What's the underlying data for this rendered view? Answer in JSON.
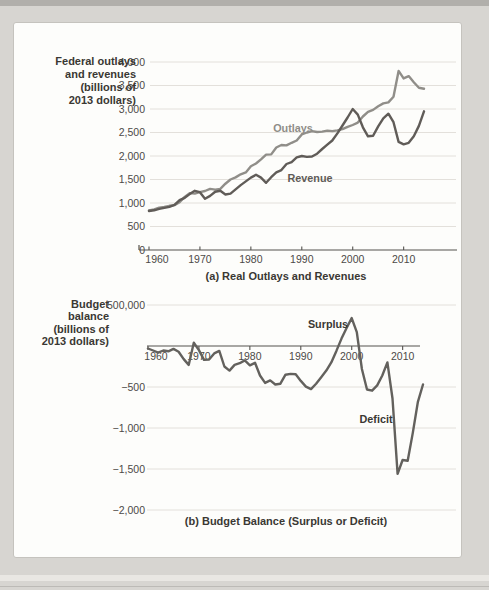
{
  "colors": {
    "outlays_line": "#908e89",
    "revenue_line": "#605c58",
    "balance_line": "#63615d",
    "gridline": "#e3e0db",
    "axis": "#55534f",
    "tick_text": "#4c4a47",
    "label_text": "#3a3833"
  },
  "chart_data": [
    {
      "panel": "a",
      "type": "line",
      "caption": "(a) Real Outlays and Revenues",
      "y_axis_title_lines": [
        "Federal outlays",
        "and revenues",
        "(billions of",
        "2013 dollars)"
      ],
      "y_tick_labels": [
        "4,000",
        "3,500",
        "3,000",
        "2,500",
        "2,000",
        "1,500",
        "1,000",
        "500",
        "0"
      ],
      "y_tick_values": [
        4000,
        3500,
        3000,
        2500,
        2000,
        1500,
        1000,
        500,
        0
      ],
      "x_tick_labels": [
        "1960",
        "1970",
        "1980",
        "1990",
        "2000",
        "2010"
      ],
      "x_tick_years": [
        1960,
        1970,
        1980,
        1990,
        2000,
        2010
      ],
      "xlim": [
        1960,
        2014
      ],
      "ylim": [
        0,
        4000
      ],
      "grid": true,
      "series": [
        {
          "name": "Outlays",
          "color": "#908e89",
          "year_start": 1960,
          "year_end": 2014,
          "values": [
            840,
            865,
            900,
            915,
            940,
            955,
            1020,
            1130,
            1210,
            1200,
            1230,
            1255,
            1300,
            1285,
            1300,
            1410,
            1500,
            1545,
            1610,
            1650,
            1780,
            1840,
            1930,
            2030,
            2035,
            2180,
            2235,
            2225,
            2280,
            2330,
            2460,
            2500,
            2530,
            2510,
            2520,
            2540,
            2530,
            2545,
            2570,
            2620,
            2660,
            2710,
            2840,
            2940,
            2980,
            3060,
            3120,
            3140,
            3260,
            3810,
            3650,
            3700,
            3570,
            3450,
            3430
          ]
        },
        {
          "name": "Revenue",
          "color": "#605c58",
          "year_start": 1960,
          "year_end": 2014,
          "values": [
            830,
            845,
            875,
            895,
            920,
            960,
            1060,
            1110,
            1190,
            1260,
            1230,
            1090,
            1150,
            1240,
            1260,
            1180,
            1200,
            1290,
            1380,
            1460,
            1540,
            1600,
            1540,
            1430,
            1550,
            1650,
            1700,
            1830,
            1870,
            1970,
            2000,
            1980,
            1990,
            2050,
            2150,
            2240,
            2330,
            2480,
            2650,
            2820,
            3000,
            2880,
            2610,
            2420,
            2430,
            2630,
            2800,
            2900,
            2720,
            2300,
            2250,
            2280,
            2420,
            2640,
            2950
          ]
        }
      ]
    },
    {
      "panel": "b",
      "type": "line",
      "caption": "(b) Budget Balance (Surplus or Deficit)",
      "y_axis_title_lines": [
        "Budget",
        "balance",
        "(billions of",
        "2013 dollars)"
      ],
      "y_tick_labels": [
        "500,000",
        "−500",
        "−1,000",
        "−1,500",
        "−2,000"
      ],
      "y_tick_values": [
        500,
        -500,
        -1000,
        -1500,
        -2000
      ],
      "x_tick_labels": [
        "1960",
        "1970",
        "1980",
        "1990",
        "2000",
        "2010"
      ],
      "x_tick_years": [
        1960,
        1970,
        1980,
        1990,
        2000,
        2010
      ],
      "xlim": [
        1960,
        2014
      ],
      "ylim": [
        -2000,
        500
      ],
      "grid": true,
      "annotations": [
        {
          "text": "Surplus"
        },
        {
          "text": "Deficit"
        }
      ],
      "series": [
        {
          "name": "Budget balance",
          "color": "#63615d",
          "year_start": 1960,
          "year_end": 2014,
          "values": [
            -30,
            -55,
            -80,
            -55,
            -65,
            -35,
            -70,
            -160,
            -230,
            40,
            -50,
            -170,
            -165,
            -90,
            -60,
            -250,
            -300,
            -230,
            -210,
            -175,
            -235,
            -205,
            -360,
            -450,
            -420,
            -470,
            -460,
            -350,
            -340,
            -345,
            -425,
            -495,
            -525,
            -460,
            -380,
            -300,
            -200,
            -60,
            90,
            220,
            340,
            170,
            -280,
            -530,
            -545,
            -480,
            -360,
            -200,
            -640,
            -1560,
            -1390,
            -1400,
            -1060,
            -680,
            -470
          ]
        }
      ]
    }
  ]
}
